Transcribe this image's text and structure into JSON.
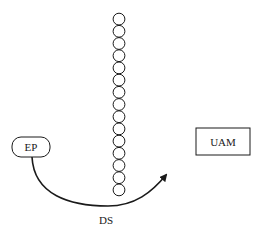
{
  "diagram": {
    "nodes": {
      "ep": {
        "label": "EP",
        "shape": "rounded-rectangle"
      },
      "uam": {
        "label": "UAM",
        "shape": "rectangle"
      }
    },
    "chain": {
      "circle_count": 15,
      "orientation": "vertical"
    },
    "edges": [
      {
        "from": "ep",
        "to": "uam",
        "label": "DS",
        "style": "curved-arrow",
        "passes_under": "chain"
      }
    ],
    "colors": {
      "stroke": "#1a1a1a",
      "background": "#ffffff"
    }
  }
}
